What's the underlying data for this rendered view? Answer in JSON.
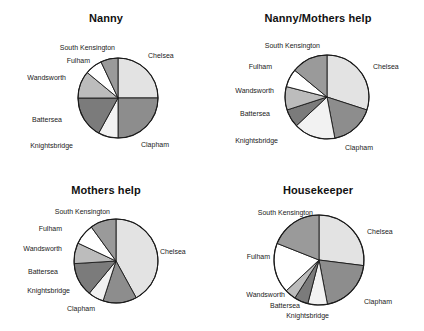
{
  "figure": {
    "background": "#ffffff",
    "panel_count": 4
  },
  "palette": {
    "Chelsea": "#e3e3e3",
    "Clapham": "#8d8d8d",
    "Knightsbridge": "#f2f2f2",
    "Battersea": "#7b7b7b",
    "Wandsworth": "#bcbcbc",
    "Fulham": "#ffffff",
    "South Kensington": "#9a9a9a",
    "outline": "#1a1a1a"
  },
  "panels": [
    {
      "key": "nanny",
      "title": "Nanny",
      "labels": {
        "chelsea": "Chelsea",
        "clapham": "Clapham",
        "knightsbridge": "Knightsbridge",
        "battersea": "Battersea",
        "wandsworth": "Wandsworth",
        "fulham": "Fulham",
        "south_kensington": "South Kensington"
      }
    },
    {
      "key": "nanny-mothers-help",
      "title": "Nanny/Mothers help",
      "labels": {
        "chelsea": "Chelsea",
        "clapham": "Clapham",
        "knightsbridge": "Knightsbridge",
        "battersea": "Battersea",
        "wandsworth": "Wandsworth",
        "fulham": "Fulham",
        "south_kensington": "South Kensington"
      }
    },
    {
      "key": "mothers-help",
      "title": "Mothers help",
      "labels": {
        "chelsea": "Chelsea",
        "clapham": "Clapham",
        "knightsbridge": "Knightsbridge",
        "battersea": "Battersea",
        "wandsworth": "Wandsworth",
        "fulham": "Fulham",
        "south_kensington": "South Kensington"
      }
    },
    {
      "key": "housekeeper",
      "title": "Housekeeper",
      "labels": {
        "chelsea": "Chelsea",
        "clapham": "Clapham",
        "knightsbridge": "Knightsbridge",
        "battersea": "Battersea",
        "wandsworth": "Wandsworth",
        "fulham": "Fulham",
        "south_kensington": "South Kensington"
      }
    }
  ],
  "chart_data": [
    {
      "type": "pie",
      "title": "Nanny",
      "categories": [
        "Chelsea",
        "Clapham",
        "Knightsbridge",
        "Battersea",
        "Wandsworth",
        "Fulham",
        "South Kensington"
      ],
      "values": [
        25,
        25,
        8,
        17,
        11,
        7,
        7
      ],
      "unit": "percent",
      "start_angle": 0,
      "direction": "clockwise",
      "colors": [
        "#e3e3e3",
        "#8d8d8d",
        "#f2f2f2",
        "#7b7b7b",
        "#bcbcbc",
        "#ffffff",
        "#9a9a9a"
      ],
      "legend": "labels-outside",
      "xlabel": "",
      "ylabel": ""
    },
    {
      "type": "pie",
      "title": "Nanny/Mothers help",
      "categories": [
        "Chelsea",
        "Clapham",
        "Knightsbridge",
        "Battersea",
        "Wandsworth",
        "Fulham",
        "South Kensington"
      ],
      "values": [
        30,
        17,
        16,
        7,
        9,
        7,
        14
      ],
      "unit": "percent",
      "start_angle": 0,
      "direction": "clockwise",
      "colors": [
        "#e3e3e3",
        "#8d8d8d",
        "#f2f2f2",
        "#7b7b7b",
        "#bcbcbc",
        "#ffffff",
        "#9a9a9a"
      ],
      "legend": "labels-outside",
      "xlabel": "",
      "ylabel": ""
    },
    {
      "type": "pie",
      "title": "Mothers help",
      "categories": [
        "Chelsea",
        "Clapham",
        "Knightsbridge",
        "Battersea",
        "Wandsworth",
        "Fulham",
        "South Kensington"
      ],
      "values": [
        42,
        13,
        6,
        13,
        8,
        8,
        10
      ],
      "unit": "percent",
      "start_angle": 0,
      "direction": "clockwise",
      "colors": [
        "#e3e3e3",
        "#8d8d8d",
        "#f2f2f2",
        "#7b7b7b",
        "#bcbcbc",
        "#ffffff",
        "#9a9a9a"
      ],
      "legend": "labels-outside",
      "xlabel": "",
      "ylabel": ""
    },
    {
      "type": "pie",
      "title": "Housekeeper",
      "categories": [
        "Chelsea",
        "Clapham",
        "Knightsbridge",
        "Battersea",
        "Wandsworth",
        "Fulham",
        "South Kensington"
      ],
      "values": [
        27,
        20,
        7,
        5,
        4,
        18,
        19
      ],
      "unit": "percent",
      "start_angle": 0,
      "direction": "clockwise",
      "colors": [
        "#e3e3e3",
        "#8d8d8d",
        "#f2f2f2",
        "#7b7b7b",
        "#bcbcbc",
        "#ffffff",
        "#9a9a9a"
      ],
      "legend": "labels-outside",
      "xlabel": "",
      "ylabel": ""
    }
  ]
}
